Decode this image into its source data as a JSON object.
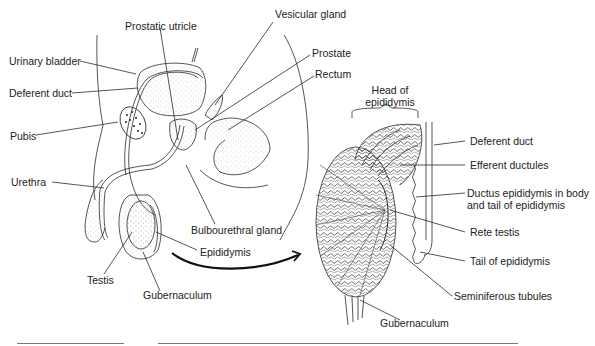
{
  "figure": {
    "type": "anatomical-diagram",
    "panels": [
      {
        "name": "sagittal-pelvis",
        "labels": [
          {
            "id": "prostatic-utricle",
            "text": "Prostatic utricle",
            "x": 125,
            "y": 20
          },
          {
            "id": "vesicular-gland",
            "text": "Vesicular gland",
            "x": 275,
            "y": 8
          },
          {
            "id": "urinary-bladder",
            "text": "Urinary bladder",
            "x": 9,
            "y": 55
          },
          {
            "id": "prostate",
            "text": "Prostate",
            "x": 312,
            "y": 47
          },
          {
            "id": "rectum",
            "text": "Rectum",
            "x": 315,
            "y": 68
          },
          {
            "id": "deferent-duct-left",
            "text": "Deferent duct",
            "x": 9,
            "y": 87
          },
          {
            "id": "pubis",
            "text": "Pubis",
            "x": 10,
            "y": 130
          },
          {
            "id": "urethra",
            "text": "Urethra",
            "x": 11,
            "y": 176
          },
          {
            "id": "bulbourethral-gland",
            "text": "Bulbourethral gland",
            "x": 191,
            "y": 224
          },
          {
            "id": "epididymis",
            "text": "Epididymis",
            "x": 200,
            "y": 246
          },
          {
            "id": "testis",
            "text": "Testis",
            "x": 87,
            "y": 274
          },
          {
            "id": "gubernaculum-left",
            "text": "Gubernaculum",
            "x": 143,
            "y": 289
          }
        ]
      },
      {
        "name": "testis-section",
        "labels": [
          {
            "id": "head-of-epididymis",
            "text": "Head of\nepididymis",
            "x": 364,
            "y": 84
          },
          {
            "id": "deferent-duct-right",
            "text": "Deferent duct",
            "x": 470,
            "y": 135
          },
          {
            "id": "efferent-ductules",
            "text": "Efferent ductules",
            "x": 470,
            "y": 159
          },
          {
            "id": "ductus-epididymis",
            "text": "Ductus epididymis in body\nand tail of epididymis",
            "x": 467,
            "y": 187
          },
          {
            "id": "rete-testis",
            "text": "Rete testis",
            "x": 470,
            "y": 226
          },
          {
            "id": "tail-of-epididymis",
            "text": "Tail of epididymis",
            "x": 470,
            "y": 255
          },
          {
            "id": "seminiferous-tubules",
            "text": "Seminiferous tubules",
            "x": 454,
            "y": 290
          },
          {
            "id": "gubernaculum-right",
            "text": "Gubernaculum",
            "x": 380,
            "y": 317
          }
        ]
      }
    ],
    "colors": {
      "line": "#2a2a2a",
      "stipple": "#9a9a9a",
      "text": "#222222",
      "rule": "#777777"
    }
  }
}
